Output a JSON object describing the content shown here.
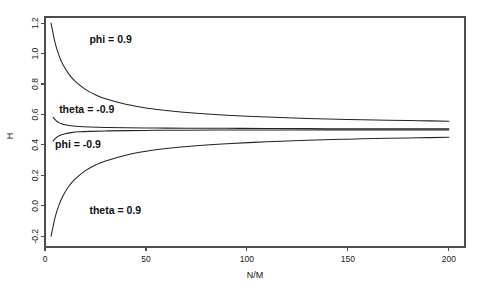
{
  "chart_data": {
    "type": "line",
    "title": "",
    "xlabel": "N/M",
    "ylabel": "H",
    "xlim": [
      0,
      208
    ],
    "ylim": [
      -0.27,
      1.24
    ],
    "grid": false,
    "legend_position": "inline-annotations",
    "xticks": [
      0,
      50,
      100,
      150,
      200
    ],
    "xtick_labels": [
      "0",
      "50",
      "100",
      "150",
      "200"
    ],
    "yticks": [
      -0.2,
      0.0,
      0.2,
      0.4,
      0.6,
      0.8,
      1.0,
      1.2
    ],
    "ytick_labels": [
      "-0.2",
      "0.0",
      "0.2",
      "0.4",
      "0.6",
      "0.8",
      "1.0",
      "1.2"
    ],
    "asymptote": 0.5,
    "series": [
      {
        "name": "phi = 0.9",
        "label": "phi = 0.9",
        "x": [
          3,
          5,
          7,
          9,
          12,
          15,
          20,
          25,
          30,
          40,
          50,
          60,
          75,
          90,
          110,
          130,
          150,
          170,
          185,
          200
        ],
        "values": [
          1.2,
          1.07,
          0.985,
          0.925,
          0.862,
          0.818,
          0.765,
          0.729,
          0.703,
          0.667,
          0.643,
          0.626,
          0.608,
          0.595,
          0.583,
          0.574,
          0.567,
          0.562,
          0.559,
          0.556
        ]
      },
      {
        "name": "theta = -0.9",
        "label": "theta = -0.9",
        "x": [
          4,
          5,
          6,
          7,
          8,
          10,
          13,
          17,
          22,
          30,
          40,
          55,
          70,
          90,
          110,
          140,
          170,
          200
        ],
        "values": [
          0.582,
          0.566,
          0.554,
          0.546,
          0.54,
          0.532,
          0.526,
          0.521,
          0.518,
          0.515,
          0.513,
          0.511,
          0.51,
          0.509,
          0.508,
          0.507,
          0.506,
          0.506
        ]
      },
      {
        "name": "phi = -0.9",
        "label": "phi = -0.9",
        "x": [
          4,
          5,
          6,
          7,
          8,
          10,
          13,
          17,
          22,
          30,
          40,
          55,
          70,
          90,
          110,
          140,
          170,
          200
        ],
        "values": [
          0.425,
          0.441,
          0.452,
          0.46,
          0.466,
          0.474,
          0.481,
          0.486,
          0.489,
          0.492,
          0.494,
          0.496,
          0.497,
          0.498,
          0.498,
          0.499,
          0.499,
          0.499
        ]
      },
      {
        "name": "theta = 0.9",
        "label": "theta = 0.9",
        "x": [
          3,
          5,
          7,
          9,
          12,
          15,
          20,
          25,
          30,
          40,
          50,
          60,
          75,
          90,
          110,
          130,
          150,
          170,
          185,
          200
        ],
        "values": [
          -0.2,
          -0.075,
          0.008,
          0.068,
          0.132,
          0.177,
          0.231,
          0.268,
          0.295,
          0.333,
          0.358,
          0.376,
          0.395,
          0.408,
          0.421,
          0.431,
          0.438,
          0.444,
          0.447,
          0.45
        ]
      }
    ],
    "annotations": [
      {
        "text": "phi = 0.9",
        "x": 22,
        "y": 1.085
      },
      {
        "text": "theta = -0.9",
        "x": 7,
        "y": 0.625
      },
      {
        "text": "phi = -0.9",
        "x": 5,
        "y": 0.4
      },
      {
        "text": "theta = 0.9",
        "x": 22,
        "y": -0.035
      }
    ],
    "colors": {
      "curve": "#232323",
      "axis": "#4d4d4d",
      "text": "#111111",
      "background": "#ffffff"
    }
  }
}
